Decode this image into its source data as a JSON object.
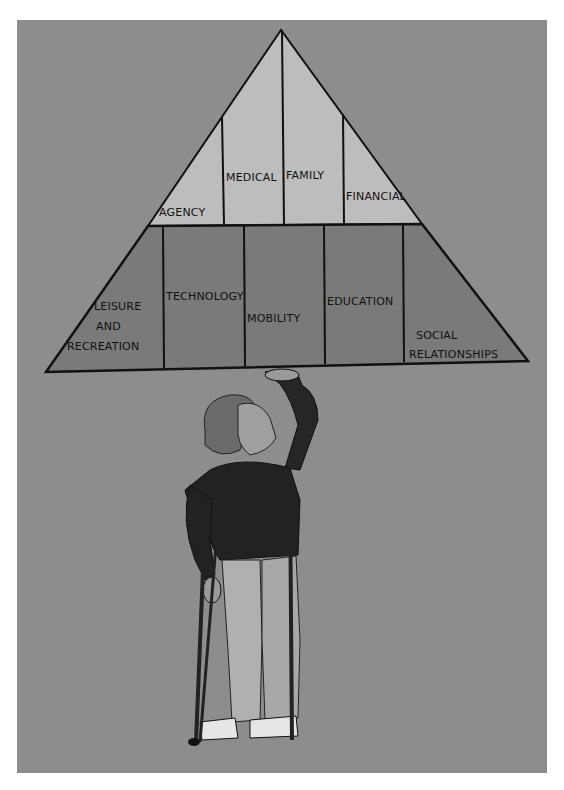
{
  "diagram": {
    "type": "pyramid",
    "colors": {
      "background": "#8d8d8d",
      "top_tier": "#bdbdbd",
      "bottom_tier": "#7a7a7a",
      "outline": "#111111"
    },
    "top_tier": {
      "labels": [
        "AGENCY",
        "MEDICAL",
        "FAMILY",
        "FINANCIAL"
      ]
    },
    "bottom_tier": {
      "labels": [
        "LEISURE",
        "AND",
        "RECREATION",
        "TECHNOLOGY",
        "MOBILITY",
        "EDUCATION",
        "SOCIAL",
        "RELATIONSHIPS"
      ]
    },
    "figure": "boy-on-crutches-supporting-pyramid"
  }
}
